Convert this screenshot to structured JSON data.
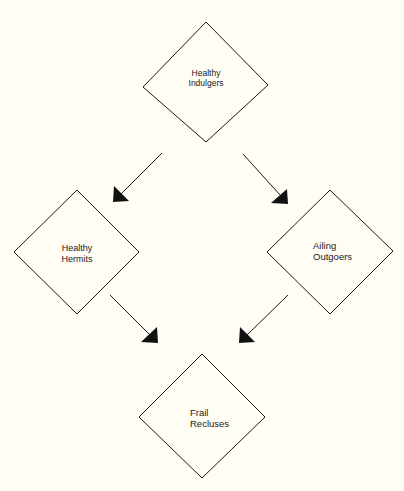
{
  "diagram": {
    "background": "#fffdf4",
    "stroke_color": "#1a1a1a",
    "nodes": [
      {
        "id": "healthy-indulgers",
        "lines": [
          "Healthy",
          "Indulgers"
        ],
        "shape": "diamond"
      },
      {
        "id": "healthy-hermits",
        "lines": [
          "Healthy",
          "Hermits"
        ],
        "shape": "diamond"
      },
      {
        "id": "ailing-outgoers",
        "lines": [
          "Ailing",
          "Outgoers"
        ],
        "shape": "diamond"
      },
      {
        "id": "frail-recluses",
        "lines": [
          "Frail",
          "Recluses"
        ],
        "shape": "diamond"
      }
    ],
    "edges": [
      {
        "from": "healthy-indulgers",
        "to": "healthy-hermits"
      },
      {
        "from": "healthy-indulgers",
        "to": "ailing-outgoers"
      },
      {
        "from": "healthy-hermits",
        "to": "frail-recluses"
      },
      {
        "from": "ailing-outgoers",
        "to": "frail-recluses"
      }
    ]
  }
}
